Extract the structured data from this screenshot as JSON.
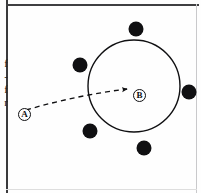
{
  "figure": {
    "background_color": "#fefefe",
    "ink_color": "#101012",
    "border_color": "#3a3a3c"
  },
  "clipped_margin_text": {
    "lines": [
      "f",
      "-",
      "f",
      "r"
    ],
    "note": "partial glyphs cut off at left edge of the scanned figure"
  },
  "region_circle": {
    "label": "large-circle",
    "center_x": 134,
    "center_y": 86,
    "radius": 46,
    "stroke_width": 1.4,
    "stroke_color": "#101012",
    "fill": "none"
  },
  "nodes": [
    {
      "id": "A",
      "label": "A",
      "x": 18,
      "y": 108,
      "type": "circled-letter"
    },
    {
      "id": "B",
      "label": "B",
      "x": 133,
      "y": 89,
      "type": "circled-letter"
    }
  ],
  "dots": [
    {
      "id": "dot-top",
      "x": 136,
      "y": 29,
      "r": 7.5
    },
    {
      "id": "dot-upper-left",
      "x": 80,
      "y": 65,
      "r": 7.5
    },
    {
      "id": "dot-right",
      "x": 189,
      "y": 92,
      "r": 7.5
    },
    {
      "id": "dot-lower-left",
      "x": 90,
      "y": 131,
      "r": 7.5
    },
    {
      "id": "dot-bottom",
      "x": 144,
      "y": 148,
      "r": 7.5
    }
  ],
  "path": {
    "id": "dashed-trajectory",
    "from": "A",
    "to": "B",
    "style": "dashed",
    "dash_pattern": "5,4",
    "stroke_width": 1.3,
    "arrowhead": true,
    "start_x": 26,
    "start_y": 110,
    "control_x": 78,
    "control_y": 95,
    "end_x": 127,
    "end_y": 89
  }
}
